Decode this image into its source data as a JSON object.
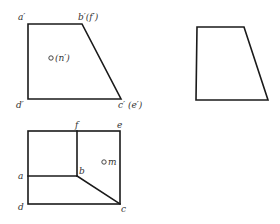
{
  "front_view": {
    "label_a": "a′",
    "label_b": "b′(f′)",
    "label_c": "c′ (e′)",
    "label_d": "d′",
    "point_label": "(n′)"
  },
  "side_view": {},
  "top_view": {
    "label_a": "a",
    "label_b": "b",
    "label_c": "c",
    "label_d": "d",
    "label_e": "e",
    "label_f": "f",
    "point_label": "m"
  },
  "colors": {
    "line": "#1a1a1a",
    "text": "#333333",
    "background": "#ffffff"
  }
}
